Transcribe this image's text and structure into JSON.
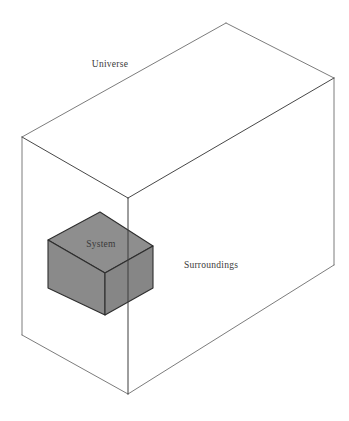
{
  "figure": {
    "type": "thermodynamic-system-diagram",
    "background_color": "#ffffff",
    "canvas": {
      "width": 349,
      "height": 421
    }
  },
  "labels": {
    "universe": "Universe",
    "system": "System",
    "surroundings": "Surroundings"
  },
  "label_positions": {
    "universe": {
      "x": 110,
      "y": 67
    },
    "system": {
      "x": 101,
      "y": 247
    },
    "surroundings": {
      "x": 211,
      "y": 268
    }
  },
  "colors": {
    "outline": "#5a5a5a",
    "outline_strong": "#3d3d3d",
    "cube_face_top": "#8e8e8e",
    "cube_face_left": "#8a8a8a",
    "cube_face_right": "#868686",
    "cube_edge": "#2e2e2e",
    "label_text": "#3a3a3a",
    "background": "#ffffff"
  },
  "outer_box": {
    "name": "universe-box",
    "vertices": {
      "back_top_left": {
        "x": 22,
        "y": 137
      },
      "back_top_apex": {
        "x": 226,
        "y": 23
      },
      "right_top": {
        "x": 334,
        "y": 78
      },
      "front_top_middle": {
        "x": 128,
        "y": 198
      },
      "back_bottom_left": {
        "x": 22,
        "y": 335
      },
      "right_bottom": {
        "x": 334,
        "y": 265
      },
      "front_bottom_middle": {
        "x": 128,
        "y": 394
      }
    }
  },
  "system_cube": {
    "name": "system-cube",
    "vertices": {
      "top_left": {
        "x": 48,
        "y": 240
      },
      "top_apex": {
        "x": 100,
        "y": 212
      },
      "top_right": {
        "x": 153,
        "y": 246
      },
      "front_center": {
        "x": 105,
        "y": 273
      },
      "bottom_left": {
        "x": 48,
        "y": 288
      },
      "bottom_front": {
        "x": 105,
        "y": 315
      },
      "bottom_right": {
        "x": 153,
        "y": 288
      }
    }
  }
}
